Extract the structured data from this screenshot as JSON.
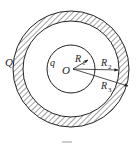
{
  "diagram": {
    "type": "concentric-spheres-electrostatics",
    "center_label": "O",
    "inner_sphere_charge_label": "q",
    "outer_shell_charge_label": "Q",
    "radii": [
      {
        "symbol": "R",
        "index": "1",
        "meaning": "radius of inner sphere"
      },
      {
        "symbol": "R",
        "index": "2",
        "meaning": "inner radius of outer shell"
      },
      {
        "symbol": "R",
        "index": "3",
        "meaning": "outer radius of outer shell"
      }
    ],
    "shell_fill": "hatched",
    "caption": ""
  },
  "colors": {
    "stroke": "#222222",
    "background": "#ffffff"
  }
}
